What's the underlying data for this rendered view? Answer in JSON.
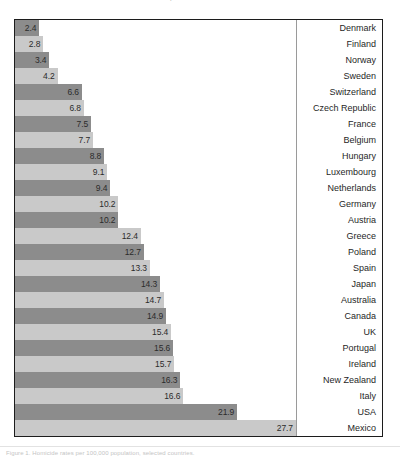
{
  "fragments": {
    "top_text": "p",
    "bottom_text": "Figure 1. Homicide rates per 100,000 population, selected countries."
  },
  "colors": {
    "bar_dark": "#8c8c8c",
    "bar_light": "#c9c9c9",
    "frame": "#1c1c1c",
    "text": "#1f1f1f",
    "divider": "#9a9a9a"
  },
  "chart_data": {
    "type": "bar",
    "orientation": "horizontal",
    "title": "",
    "subtitle": "",
    "xlabel": "",
    "ylabel": "",
    "xlim": [
      0,
      27.7
    ],
    "grid": false,
    "legend": "none",
    "value_label_position": "inside-end",
    "category_label_position": "right-column",
    "bar_color_pattern": [
      "dark",
      "light"
    ],
    "categories": [
      "Denmark",
      "Finland",
      "Norway",
      "Sweden",
      "Switzerland",
      "Czech Republic",
      "France",
      "Belgium",
      "Hungary",
      "Luxembourg",
      "Netherlands",
      "Germany",
      "Austria",
      "Greece",
      "Poland",
      "Spain",
      "Japan",
      "Australia",
      "Canada",
      "UK",
      "Portugal",
      "Ireland",
      "New Zealand",
      "Italy",
      "USA",
      "Mexico"
    ],
    "values": [
      2.4,
      2.8,
      3.4,
      4.2,
      6.6,
      6.8,
      7.5,
      7.7,
      8.8,
      9.1,
      9.4,
      10.2,
      10.2,
      12.4,
      12.7,
      13.3,
      14.3,
      14.7,
      14.9,
      15.4,
      15.6,
      15.7,
      16.3,
      16.6,
      21.9,
      27.7
    ],
    "value_labels": [
      "2.4",
      "2.8",
      "3.4",
      "4.2",
      "6.6",
      "6.8",
      "7.5",
      "7.7",
      "8.8",
      "9.1",
      "9.4",
      "10.2",
      "10.2",
      "12.4",
      "12.7",
      "13.3",
      "14.3",
      "14.7",
      "14.9",
      "15.4",
      "15.6",
      "15.7",
      "16.3",
      "16.6",
      "21.9",
      "27.7"
    ]
  }
}
